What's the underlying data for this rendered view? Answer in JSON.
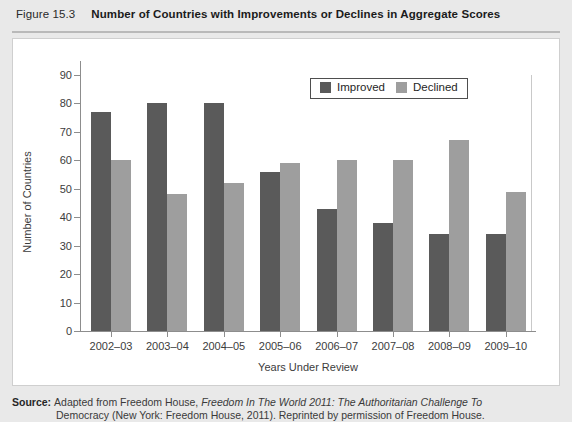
{
  "header": {
    "figure_number": "Figure 15.3",
    "title": "Number of Countries with Improvements or Declines in Aggregate Scores"
  },
  "source": {
    "label": "Source:",
    "text_before_italic": "Adapted from Freedom House, ",
    "italic_text": "Freedom In The World 2011: The Authoritarian Challenge To",
    "line2": "Democracy (New York: Freedom House, 2011). Reprinted by permission of Freedom House."
  },
  "colors": {
    "improved": "#5a5a5a",
    "declined": "#9e9e9e",
    "axis": "#8d8d8d",
    "header_band": "#e9e9e9",
    "plot_background": "#ffffff"
  },
  "chart_data": {
    "type": "bar",
    "title": "Number of Countries with Improvements or Declines in Aggregate Scores",
    "xlabel": "Years Under Review",
    "ylabel": "Number of Countries",
    "categories": [
      "2002–03",
      "2003–04",
      "2004–05",
      "2005–06",
      "2006–07",
      "2007–08",
      "2008–09",
      "2009–10"
    ],
    "series": [
      {
        "name": "Improved",
        "color": "#5a5a5a",
        "values": [
          77,
          80,
          80,
          56,
          43,
          38,
          34,
          34
        ]
      },
      {
        "name": "Declined",
        "color": "#9e9e9e",
        "values": [
          60,
          48,
          52,
          59,
          60,
          60,
          67,
          49
        ]
      }
    ],
    "ylim": [
      0,
      90
    ],
    "ytick_step": 10,
    "yticks": [
      0,
      10,
      20,
      30,
      40,
      50,
      60,
      70,
      80,
      90
    ],
    "grid": false,
    "legend_position": "top-right",
    "legend_entries": [
      "Improved",
      "Declined"
    ]
  }
}
